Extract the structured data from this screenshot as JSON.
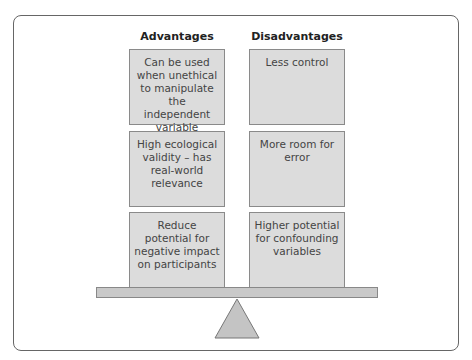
{
  "diagram": {
    "type": "balance-scale",
    "columns": [
      {
        "heading": "Advantages",
        "items": [
          "Can be used when unethical to manipulate the independent variable",
          "High ecological validity – has real-world relevance",
          "Reduce potential for negative impact on participants"
        ]
      },
      {
        "heading": "Disadvantages",
        "items": [
          "Less control",
          "More room for error",
          "Higher potential for confounding variables"
        ]
      }
    ],
    "colors": {
      "box_fill": "#dcdcdc",
      "box_border": "#8a8a8a",
      "beam_fill": "#c9c9c9",
      "fulcrum_fill": "#c4c4c4",
      "frame_border": "#666666"
    }
  }
}
